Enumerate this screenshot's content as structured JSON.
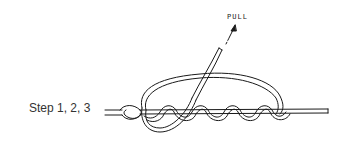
{
  "diagram": {
    "step_label": "Step 1, 2, 3",
    "pull_label": "PULL",
    "line_color": "#1a1a1a",
    "background": "#ffffff"
  }
}
